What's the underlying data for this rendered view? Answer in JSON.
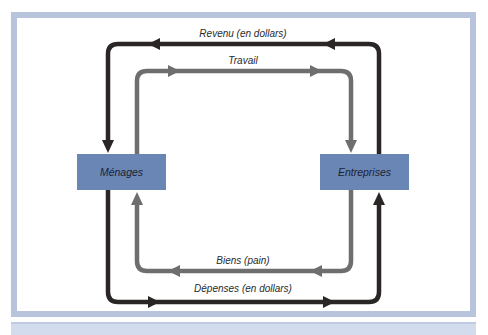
{
  "diagram": {
    "type": "circular-flow",
    "nodes": {
      "households": {
        "label": "Ménages"
      },
      "firms": {
        "label": "Entreprises"
      }
    },
    "flows": [
      {
        "id": "income",
        "label": "Revenu (en dollars)",
        "from": "Entreprises",
        "to": "Ménages",
        "style": "dark"
      },
      {
        "id": "labor",
        "label": "Travail",
        "from": "Ménages",
        "to": "Entreprises",
        "style": "gray"
      },
      {
        "id": "goods",
        "label": "Biens (pain)",
        "from": "Entreprises",
        "to": "Ménages",
        "style": "gray"
      },
      {
        "id": "spending",
        "label": "Dépenses (en dollars)",
        "from": "Ménages",
        "to": "Entreprises",
        "style": "dark"
      }
    ],
    "colors": {
      "frame": "#b7c4dc",
      "node_fill": "#6a86b5",
      "dark_flow": "#2b2626",
      "gray_flow": "#6e6e6e"
    }
  }
}
